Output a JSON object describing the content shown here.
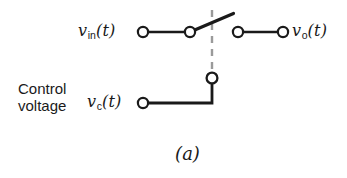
{
  "figure": {
    "caption": "(a)",
    "background_color": "#ffffff",
    "wire_color": "#1a1a1a",
    "dashed_line_color": "#9a9a9a",
    "width": 347,
    "height": 178
  },
  "labels": {
    "input": {
      "symbol": "v",
      "subscript": "in",
      "argument": "(t)"
    },
    "output": {
      "symbol": "v",
      "subscript": "o",
      "argument": "(t)"
    },
    "control": {
      "symbol": "v",
      "subscript": "c",
      "argument": "(t)"
    },
    "control_voltage_line1": "Control",
    "control_voltage_line2": "voltage"
  },
  "diagram_data": {
    "type": "circuit-schematic",
    "description": "Voltage-controlled switch schematic",
    "terminals": [
      {
        "name": "input-terminal",
        "x": 143,
        "y": 32
      },
      {
        "name": "switch-pivot-terminal",
        "x": 190,
        "y": 32
      },
      {
        "name": "switch-contact-terminal",
        "x": 238,
        "y": 32
      },
      {
        "name": "output-terminal",
        "x": 283,
        "y": 32
      },
      {
        "name": "control-node-terminal",
        "x": 212,
        "y": 78
      },
      {
        "name": "control-input-terminal",
        "x": 143,
        "y": 103
      }
    ],
    "wires": [
      {
        "name": "input-wire",
        "x1": 143,
        "y1": 32,
        "x2": 190,
        "y2": 32
      },
      {
        "name": "output-wire",
        "x1": 238,
        "y1": 32,
        "x2": 283,
        "y2": 32
      },
      {
        "name": "switch-blade",
        "x1": 190,
        "y1": 32,
        "x2": 233,
        "y2": 14
      },
      {
        "name": "control-vertical-wire",
        "x1": 212,
        "y1": 78,
        "x2": 212,
        "y2": 103
      },
      {
        "name": "control-horizontal-wire",
        "x1": 212,
        "y1": 103,
        "x2": 143,
        "y2": 103
      }
    ],
    "dashed_actuator": {
      "name": "actuator-dashed-line",
      "x": 212,
      "y1": 10,
      "y2": 72
    }
  }
}
